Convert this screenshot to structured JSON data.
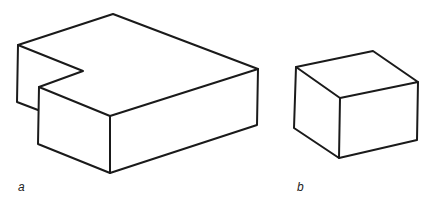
{
  "figures": [
    {
      "label": "a",
      "description": "L-shaped block with notched corner"
    },
    {
      "label": "b",
      "description": "Rectangular block"
    }
  ],
  "colors": {
    "stroke": "#1a1a1a",
    "background": "#ffffff"
  }
}
